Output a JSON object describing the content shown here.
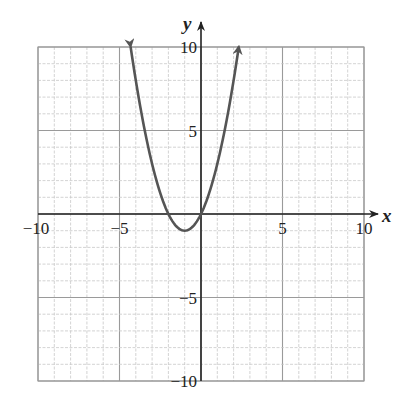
{
  "chart_data": {
    "type": "line",
    "title": "",
    "function": "y = x^2 + 2x",
    "xlabel": "x",
    "ylabel": "y",
    "xlim": [
      -10,
      10
    ],
    "ylim": [
      -10,
      10
    ],
    "grid": true,
    "minor_grid_step": 1,
    "major_grid_step": 5,
    "x_ticks": [
      -10,
      -5,
      5,
      10
    ],
    "y_ticks": [
      -10,
      -5,
      5,
      10
    ],
    "x_tick_labels": [
      "−10",
      "−5",
      "5",
      "10"
    ],
    "y_tick_labels": [
      "−10",
      "−5",
      "5",
      "10"
    ],
    "vertex": [
      -1,
      -1
    ],
    "x_intercepts": [
      -2,
      0
    ],
    "series": [
      {
        "name": "parabola",
        "color": "#555555",
        "x": [
          -4.32,
          -4,
          -3,
          -2,
          -1,
          0,
          1,
          2,
          2.32
        ],
        "y": [
          10,
          8,
          3,
          0,
          -1,
          0,
          3,
          8,
          10
        ],
        "arrows_at_ends": true
      }
    ]
  },
  "colors": {
    "grid_minor": "#c8c8c8",
    "grid_major": "#9a9a9a",
    "axis": "#222222",
    "curve": "#555555"
  }
}
